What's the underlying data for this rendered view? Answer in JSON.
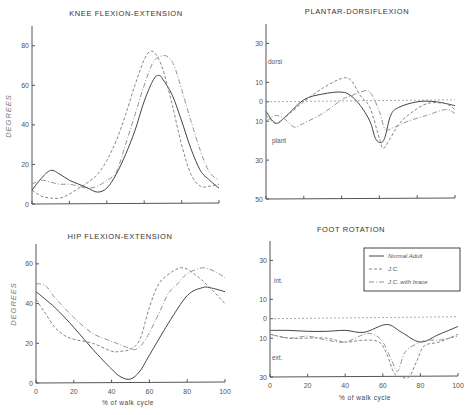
{
  "chart_data": [
    {
      "type": "line",
      "id": "knee",
      "title": "KNEE FLEXION-EXTENSION",
      "xlabel": "",
      "ylabel": "DEGREES",
      "xlim": [
        0,
        100
      ],
      "ylim": [
        0,
        90
      ],
      "yticks": [
        0,
        20,
        40,
        60,
        80
      ],
      "ytick_labels": [
        "0",
        "20",
        "40",
        "60",
        "80"
      ],
      "xticks": [
        0,
        20,
        40,
        60,
        80,
        100
      ],
      "xtick_labels": [],
      "frame": {
        "x0": 32,
        "x1": 219,
        "y_at_min": 204,
        "y_at_max": 26,
        "ymin": 0,
        "ymax": 90
      },
      "series": [
        {
          "name": "Normal Adult",
          "style": "solid",
          "x": [
            0,
            5,
            10,
            15,
            20,
            25,
            30,
            35,
            40,
            45,
            50,
            55,
            60,
            65,
            68,
            70,
            75,
            80,
            85,
            90,
            95,
            100
          ],
          "values": [
            7,
            13,
            17,
            15,
            12,
            10,
            8,
            6,
            8,
            15,
            25,
            37,
            52,
            63,
            65,
            63,
            55,
            42,
            28,
            17,
            12,
            8
          ]
        },
        {
          "name": "J.C.",
          "style": "dashed",
          "x": [
            0,
            5,
            10,
            15,
            20,
            25,
            30,
            35,
            40,
            45,
            50,
            55,
            60,
            63,
            66,
            70,
            75,
            80,
            85,
            90,
            95,
            100
          ],
          "values": [
            7,
            4,
            3,
            3,
            5,
            8,
            11,
            15,
            22,
            32,
            45,
            60,
            73,
            77,
            76,
            68,
            50,
            30,
            15,
            9,
            9,
            10
          ]
        },
        {
          "name": "J.C. with brace",
          "style": "dashdot",
          "x": [
            0,
            5,
            10,
            15,
            20,
            25,
            30,
            35,
            40,
            45,
            50,
            55,
            60,
            65,
            70,
            73,
            76,
            80,
            85,
            90,
            95,
            100
          ],
          "values": [
            10,
            12,
            11,
            10,
            10,
            9,
            8,
            9,
            12,
            16,
            30,
            45,
            60,
            72,
            75,
            74,
            70,
            58,
            42,
            27,
            16,
            12
          ]
        }
      ]
    },
    {
      "type": "line",
      "id": "plantar",
      "title": "PLANTAR-DORSIFLEXION",
      "xlabel": "",
      "ylabel": "",
      "annotations": [
        "dorsi",
        "plant"
      ],
      "xlim": [
        0,
        100
      ],
      "ylim": [
        -50,
        35
      ],
      "yticks": [
        30,
        10,
        0,
        -10,
        -30,
        -50
      ],
      "ytick_labels": [
        "30",
        "10",
        "0",
        "10",
        "30",
        "50"
      ],
      "xticks": [
        0,
        20,
        40,
        60,
        80,
        100
      ],
      "xtick_labels": [],
      "zero_line": true,
      "frame": {
        "x0": 266,
        "x1": 455,
        "y_at_min": 199,
        "y_at_max": 24,
        "ymin": -50,
        "ymax": 40
      },
      "series": [
        {
          "name": "Normal Adult",
          "style": "solid",
          "x": [
            0,
            5,
            10,
            20,
            30,
            40,
            45,
            50,
            55,
            58,
            61,
            63,
            66,
            70,
            80,
            90,
            100
          ],
          "values": [
            -5,
            -11,
            -8,
            1,
            4,
            5,
            3,
            -2,
            -10,
            -19,
            -21,
            -18,
            -7,
            -3,
            0,
            0,
            -2
          ]
        },
        {
          "name": "J.C.",
          "style": "dashed",
          "x": [
            0,
            5,
            10,
            20,
            30,
            40,
            45,
            50,
            55,
            60,
            62,
            65,
            70,
            75,
            85,
            95,
            100
          ],
          "values": [
            -7,
            -11,
            -8,
            0,
            7,
            12,
            11,
            3,
            -3,
            -19,
            -24,
            -20,
            -12,
            -7,
            -1,
            -1,
            -4
          ]
        },
        {
          "name": "J.C. with brace",
          "style": "dashdot",
          "x": [
            0,
            5,
            10,
            15,
            20,
            30,
            40,
            45,
            50,
            55,
            60,
            63,
            68,
            75,
            85,
            95,
            100
          ],
          "values": [
            -10,
            -7,
            -9,
            -13,
            -11,
            -6,
            1,
            3,
            5,
            5,
            -5,
            -14,
            -13,
            -10,
            -7,
            -4,
            -6
          ]
        }
      ]
    },
    {
      "type": "line",
      "id": "hip",
      "title": "HIP FLEXION-EXTENSION",
      "xlabel": "% of walk cycle",
      "ylabel": "DEGREES",
      "xlim": [
        0,
        100
      ],
      "ylim": [
        0,
        70
      ],
      "yticks": [
        0,
        20,
        40,
        60
      ],
      "ytick_labels": [
        "0",
        "20",
        "40",
        "60"
      ],
      "xticks": [
        0,
        20,
        40,
        60,
        80,
        100
      ],
      "xtick_labels": [
        "0",
        "20",
        "40",
        "60",
        "80",
        "100"
      ],
      "frame": {
        "x0": 36,
        "x1": 225,
        "y_at_min": 383,
        "y_at_max": 244,
        "ymin": 0,
        "ymax": 70
      },
      "series": [
        {
          "name": "Normal Adult",
          "style": "solid",
          "x": [
            0,
            10,
            20,
            30,
            40,
            45,
            50,
            55,
            60,
            70,
            80,
            88,
            92,
            100
          ],
          "values": [
            46,
            38,
            28,
            17,
            7,
            3,
            2,
            6,
            14,
            30,
            44,
            48,
            48,
            46
          ]
        },
        {
          "name": "J.C.",
          "style": "dashed",
          "x": [
            0,
            5,
            10,
            15,
            20,
            30,
            40,
            45,
            50,
            55,
            60,
            65,
            72,
            78,
            85,
            92,
            100
          ],
          "values": [
            42,
            35,
            28,
            24,
            22,
            20,
            16,
            16,
            17,
            22,
            38,
            50,
            56,
            58,
            54,
            48,
            40
          ]
        },
        {
          "name": "J.C. with brace",
          "style": "dashdot",
          "x": [
            0,
            5,
            10,
            20,
            30,
            40,
            48,
            53,
            58,
            65,
            70,
            75,
            80,
            88,
            95,
            100
          ],
          "values": [
            50,
            49,
            43,
            33,
            25,
            21,
            18,
            17,
            22,
            35,
            45,
            50,
            55,
            58,
            56,
            53
          ]
        }
      ]
    },
    {
      "type": "line",
      "id": "foot",
      "title": "FOOT ROTATION",
      "xlabel": "% of walk cycle",
      "ylabel": "",
      "annotations": [
        "int.",
        "ext."
      ],
      "xlim": [
        0,
        100
      ],
      "ylim": [
        -30,
        35
      ],
      "yticks": [
        30,
        10,
        0,
        -10,
        -30
      ],
      "ytick_labels": [
        "30",
        "10",
        "0",
        "10",
        "30"
      ],
      "xticks": [
        0,
        20,
        40,
        60,
        80,
        100
      ],
      "xtick_labels": [
        "0",
        "20",
        "40",
        "60",
        "80",
        "100"
      ],
      "zero_line": true,
      "legend": {
        "position": "upper right",
        "entries": [
          "Normal Adult",
          "J.C.",
          "J.C. with brace"
        ]
      },
      "frame": {
        "x0": 270,
        "x1": 458,
        "y_at_min": 377,
        "y_at_max": 241,
        "ymin": -30,
        "ymax": 40
      },
      "series": [
        {
          "name": "Normal Adult",
          "style": "solid",
          "x": [
            0,
            10,
            20,
            30,
            40,
            50,
            62,
            70,
            80,
            90,
            100
          ],
          "values": [
            -6,
            -6,
            -6.5,
            -6.5,
            -6,
            -7,
            -3,
            -7,
            -12,
            -8,
            -4
          ]
        },
        {
          "name": "J.C.",
          "style": "dashed",
          "x": [
            0,
            10,
            20,
            30,
            40,
            50,
            58,
            62,
            66,
            70,
            74,
            78,
            82,
            90,
            100
          ],
          "values": [
            -8,
            -10,
            -10,
            -10,
            -12,
            -11,
            -12,
            -18,
            -28,
            -30,
            -30,
            -22,
            -14,
            -12,
            -8
          ]
        },
        {
          "name": "J.C. with brace",
          "style": "dashdot",
          "x": [
            0,
            10,
            20,
            30,
            40,
            50,
            55,
            60,
            65,
            68,
            72,
            80,
            85,
            90,
            100
          ],
          "values": [
            -8,
            -10,
            -9,
            -11,
            -12,
            -8,
            -8,
            -12,
            -22,
            -27,
            -17,
            -12,
            -11,
            -11,
            -9
          ]
        }
      ]
    }
  ],
  "labels": {
    "knee_title": "KNEE FLEXION-EXTENSION",
    "plantar_title": "PLANTAR-DORSIFLEXION",
    "hip_title": "HIP FLEXION-EXTENSION",
    "foot_title": "FOOT ROTATION",
    "degrees": "DEGREES",
    "xlabel": "% of walk cycle",
    "dorsi": "dorsi",
    "plant": "plant",
    "int": "int.",
    "ext": "ext.",
    "legend": [
      "Normal Adult",
      "J.C.",
      "J.C. with brace"
    ]
  }
}
